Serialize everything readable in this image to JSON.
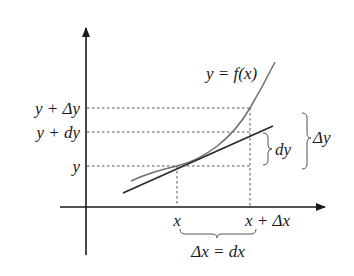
{
  "figure": {
    "colors": {
      "axis": "#1a1a1a",
      "curve": "#6e6e6e",
      "tangent": "#2a2a2a",
      "dashed": "#555555",
      "text": "#1a1a1a",
      "background": "#ffffff"
    },
    "labels": {
      "curve": "y = f(x)",
      "y_tick_top": "y +  Δy",
      "y_tick_mid": "y + dy",
      "y_tick_base": "y",
      "x_tick_left": "x",
      "x_tick_right": "x + Δx",
      "brace_dy": "dy",
      "brace_delta_y": "Δy",
      "brace_dx": "Δx = dx"
    }
  }
}
